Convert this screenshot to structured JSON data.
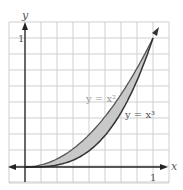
{
  "chart_data": {
    "type": "area",
    "title": "",
    "xlabel": "x",
    "ylabel": "y",
    "x_ticks": [
      "1"
    ],
    "y_ticks": [
      "1"
    ],
    "xlim": [
      -0.125,
      1.09
    ],
    "ylim": [
      -0.12,
      1.0
    ],
    "grid": true,
    "grid_step": 0.125,
    "series": [
      {
        "name": "y = x^2",
        "label": "y = x²",
        "function": "x^2",
        "x": [
          0,
          0.25,
          0.5,
          0.75,
          1
        ],
        "values": [
          0,
          0.0625,
          0.25,
          0.5625,
          1
        ]
      },
      {
        "name": "y = x^3",
        "label": "y = x³",
        "function": "x^3",
        "x": [
          0,
          0.25,
          0.5,
          0.75,
          1
        ],
        "values": [
          0,
          0.015625,
          0.125,
          0.421875,
          1
        ]
      }
    ],
    "shaded_region": {
      "between": [
        "y = x^2",
        "y = x^3"
      ],
      "x_range": [
        0,
        1
      ],
      "color": "#c8c8c8"
    },
    "annotations": [
      "y = x²",
      "y = x³"
    ]
  },
  "labels": {
    "x_axis": "x",
    "y_axis": "y",
    "x_tick": "1",
    "y_tick": "1",
    "curve_top": "y = x²",
    "curve_bottom": "y = x³"
  }
}
